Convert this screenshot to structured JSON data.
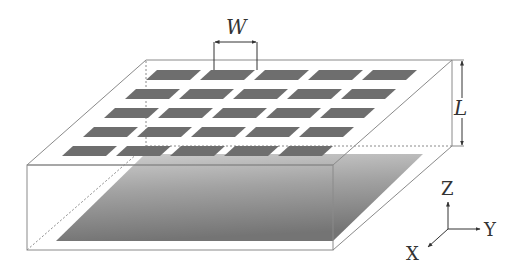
{
  "diagram": {
    "labels": {
      "width": "W",
      "length": "L",
      "axis_x": "X",
      "axis_y": "Y",
      "axis_z": "Z"
    },
    "patch_grid": {
      "rows": 5,
      "cols": 5
    },
    "colors": {
      "outline": "#8a8a8a",
      "patch": "#6e6e6e",
      "ground_dark": "#7a7a7a",
      "ground_light": "#c8c8c8",
      "text": "#333333"
    }
  }
}
